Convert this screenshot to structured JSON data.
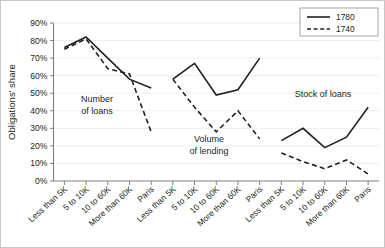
{
  "chart_data": {
    "type": "line",
    "title": "",
    "xlabel": "",
    "ylabel": "Obligations' share",
    "ylim": [
      0,
      90
    ],
    "grid": true,
    "legend_position": "top-right",
    "ytick_labels": [
      "0%",
      "10%",
      "20%",
      "30%",
      "40%",
      "50%",
      "60%",
      "70%",
      "80%",
      "90%"
    ],
    "ytick_values": [
      0,
      10,
      20,
      30,
      40,
      50,
      60,
      70,
      80,
      90
    ],
    "categories": [
      "Less than 5K",
      "5 to 10K",
      "10 to 60K",
      "More than 60K",
      "Paris"
    ],
    "x": [
      "Less than 5K",
      "5 to 10K",
      "10 to 60K",
      "More than 60K",
      "Paris",
      "Less than 5K",
      "5 to 10K",
      "10 to 60K",
      "More than 60K",
      "Paris",
      "Less than 5K",
      "5 to 10K",
      "10 to 60K",
      "More than 60K",
      "Paris"
    ],
    "panels": [
      {
        "label": "Number\nof loans",
        "label_line1": "Number",
        "label_line2": "of loans",
        "categories": [
          "Less than 5K",
          "5 to 10K",
          "10 to 60K",
          "More than 60K",
          "Paris"
        ],
        "series": [
          {
            "name": "1780",
            "style": "solid",
            "values": [
              76,
              82,
              70,
              58,
              53
            ]
          },
          {
            "name": "1740",
            "style": "dashed",
            "values": [
              75,
              81,
              64,
              61,
              28
            ]
          }
        ]
      },
      {
        "label": "Volume\nof lending",
        "label_line1": "Volume",
        "label_line2": "of lending",
        "categories": [
          "Less than 5K",
          "5 to 10K",
          "10 to 60K",
          "More than 60K",
          "Paris"
        ],
        "series": [
          {
            "name": "1780",
            "style": "solid",
            "values": [
              58,
              67,
              49,
              52,
              70
            ]
          },
          {
            "name": "1740",
            "style": "dashed",
            "values": [
              58,
              42,
              28,
              40,
              24
            ]
          }
        ]
      },
      {
        "label": "Stock of loans",
        "label_line1": "Stock of loans",
        "label_line2": "",
        "categories": [
          "Less than 5K",
          "5 to 10K",
          "10 to 60K",
          "More than 60K",
          "Paris"
        ],
        "series": [
          {
            "name": "1780",
            "style": "solid",
            "values": [
              23,
              30,
              19,
              25,
              42
            ]
          },
          {
            "name": "1740",
            "style": "dashed",
            "values": [
              16,
              11,
              7,
              12,
              4
            ]
          }
        ]
      }
    ],
    "legend": [
      {
        "label": "1780",
        "style": "solid",
        "color": "#231f20"
      },
      {
        "label": "1740",
        "style": "dashed",
        "color": "#231f20"
      }
    ],
    "colors": {
      "series_line": "#231f20",
      "grid": "#ededed",
      "axis": "#808080",
      "background": "#ffffff",
      "text": "#231f20"
    }
  }
}
